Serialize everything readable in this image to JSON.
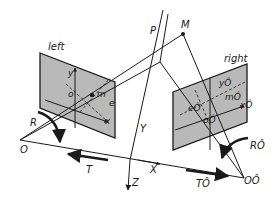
{
  "diagram": {
    "type": "stereo-camera-geometry",
    "colors": {
      "plane_fill": "#b9b9b9",
      "stroke": "#1a1a1a",
      "background": "#ffffff"
    },
    "points": {
      "P": "P",
      "M": "M",
      "O": "O",
      "O_right": "OÔ"
    },
    "left_camera": {
      "title": "left",
      "labels": {
        "y": "y",
        "o": "o",
        "m": "m",
        "e": "e",
        "x": "x"
      },
      "rotation": "R"
    },
    "right_camera": {
      "title": "right",
      "labels": {
        "y": "yÔ",
        "o": "oÔ",
        "m": "mÔ",
        "e": "eÔ",
        "x": "xÔ"
      },
      "rotation": "RÔ"
    },
    "world_axes": {
      "X": "X",
      "Y": "Y",
      "Z": "Z"
    },
    "translations": {
      "left": "T",
      "right": "TÔ"
    }
  }
}
